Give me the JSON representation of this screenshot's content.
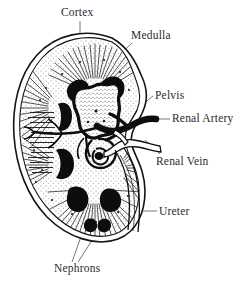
{
  "figure": {
    "style": "black-and-white engraved line illustration",
    "background_color": "#ffffff",
    "ink_color": "#1a1a1a",
    "label_color": "#2b2b2b"
  },
  "labels": {
    "cortex": "Cortex",
    "medulla": "Medulla",
    "pelvis": "Pelvis",
    "renal_artery": "Renal Artery",
    "renal_vein": "Renal Vein",
    "ureter": "Ureter",
    "nephrons": "Nephrons"
  },
  "structures": [
    {
      "id": "capsule",
      "name": "Renal capsule outline"
    },
    {
      "id": "cortex",
      "name": "Cortex"
    },
    {
      "id": "medulla",
      "name": "Medulla with renal pyramids"
    },
    {
      "id": "pelvis",
      "name": "Renal pelvis"
    },
    {
      "id": "renal-artery",
      "name": "Renal artery"
    },
    {
      "id": "renal-vein",
      "name": "Renal vein"
    },
    {
      "id": "ureter",
      "name": "Ureter"
    },
    {
      "id": "nephrons",
      "name": "Nephrons"
    }
  ]
}
